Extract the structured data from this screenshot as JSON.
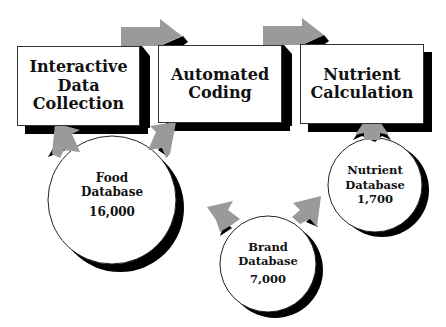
{
  "diagram": {
    "process_boxes": [
      {
        "lines": [
          "Interactive",
          "Data",
          "Collection"
        ]
      },
      {
        "lines": [
          "Automated",
          "Coding"
        ]
      },
      {
        "lines": [
          "Nutrient",
          "Calculation"
        ]
      }
    ],
    "databases": [
      {
        "lines": [
          "Food",
          "Database"
        ],
        "count": "16,000"
      },
      {
        "lines": [
          "Nutrient",
          "Database"
        ],
        "count": "1,700"
      },
      {
        "lines": [
          "Brand",
          "Database"
        ],
        "count": "7,000"
      }
    ],
    "colors": {
      "arrow": "#9a9a9a",
      "shadow": "#000000",
      "box_fill": "#ffffff",
      "text": "#111111"
    }
  }
}
